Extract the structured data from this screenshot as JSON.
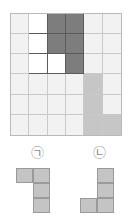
{
  "board": {
    "rows": 6,
    "cols": 6,
    "colors": {
      "light": "#f2f2f2",
      "white": "#ffffff",
      "dark": "#7d7d7d",
      "mid": "#c6c6c6",
      "grid_line": "#c9c9c9",
      "border": "#b9b9b9",
      "shape_outline": "#5a5a5a"
    },
    "cells": [
      [
        "light",
        "white",
        "dark",
        "dark",
        "light",
        "light"
      ],
      [
        "light",
        "white",
        "dark",
        "dark",
        "light",
        "light"
      ],
      [
        "light",
        "white",
        "white",
        "dark",
        "light",
        "light"
      ],
      [
        "light",
        "light",
        "light",
        "light",
        "mid",
        "light"
      ],
      [
        "light",
        "light",
        "light",
        "light",
        "mid",
        "light"
      ],
      [
        "light",
        "light",
        "light",
        "light",
        "mid",
        "mid"
      ]
    ]
  },
  "labels": [
    {
      "id": "a",
      "text": "㉠"
    },
    {
      "id": "b",
      "text": "㉡"
    }
  ],
  "pieces": [
    {
      "id": "a",
      "label": "㉠",
      "rows": 3,
      "cols": 2,
      "fill_color": "#c4c4c4",
      "outline_color": "#9a9a9a",
      "cells": [
        [
          1,
          1
        ],
        [
          0,
          1
        ],
        [
          0,
          1
        ]
      ]
    },
    {
      "id": "b",
      "label": "㉡",
      "rows": 3,
      "cols": 2,
      "fill_color": "#c4c4c4",
      "outline_color": "#9a9a9a",
      "cells": [
        [
          0,
          1
        ],
        [
          0,
          1
        ],
        [
          1,
          1
        ]
      ]
    }
  ]
}
